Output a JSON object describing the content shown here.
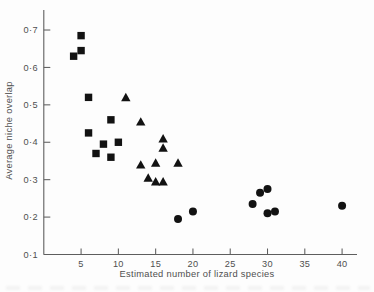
{
  "figure": {
    "background": "#fdfdfd",
    "axis_color": "#5e5e5e",
    "text_color": "#4f4f4f",
    "marker_color": "#121212"
  },
  "chart_data": {
    "type": "scatter",
    "title": "",
    "xlabel": "Estimated number of lizard species",
    "ylabel": "Average niche overlap",
    "xlim": [
      0,
      42
    ],
    "ylim": [
      0.1,
      0.7535
    ],
    "grid": false,
    "legend": "none",
    "x_ticks": [
      {
        "v": 5,
        "label": "5"
      },
      {
        "v": 10,
        "label": "10"
      },
      {
        "v": 15,
        "label": "15"
      },
      {
        "v": 20,
        "label": "20"
      },
      {
        "v": 25,
        "label": "25"
      },
      {
        "v": 30,
        "label": "30"
      },
      {
        "v": 35,
        "label": "35"
      },
      {
        "v": 40,
        "label": "40"
      }
    ],
    "y_ticks": [
      {
        "v": 0.1,
        "label": "0·1"
      },
      {
        "v": 0.2,
        "label": "0·2"
      },
      {
        "v": 0.3,
        "label": "0·3"
      },
      {
        "v": 0.4,
        "label": "0·4"
      },
      {
        "v": 0.5,
        "label": "0·5"
      },
      {
        "v": 0.6,
        "label": "0·6"
      },
      {
        "v": 0.7,
        "label": "0·7"
      }
    ],
    "series": [
      {
        "name": "filled-squares",
        "marker": "square",
        "color": "#121212",
        "points": [
          [
            5,
            0.685
          ],
          [
            5,
            0.645
          ],
          [
            4,
            0.63
          ],
          [
            6,
            0.52
          ],
          [
            9,
            0.46
          ],
          [
            6,
            0.425
          ],
          [
            8,
            0.395
          ],
          [
            10,
            0.4
          ],
          [
            7,
            0.37
          ],
          [
            9,
            0.36
          ]
        ]
      },
      {
        "name": "filled-triangles",
        "marker": "triangle",
        "color": "#121212",
        "points": [
          [
            11,
            0.52
          ],
          [
            13,
            0.455
          ],
          [
            16,
            0.41
          ],
          [
            16,
            0.385
          ],
          [
            15,
            0.345
          ],
          [
            13,
            0.34
          ],
          [
            18,
            0.345
          ],
          [
            14,
            0.305
          ],
          [
            15,
            0.295
          ],
          [
            16,
            0.295
          ]
        ]
      },
      {
        "name": "filled-circles",
        "marker": "circle",
        "color": "#121212",
        "points": [
          [
            18,
            0.195
          ],
          [
            20,
            0.215
          ],
          [
            28,
            0.235
          ],
          [
            29,
            0.265
          ],
          [
            30,
            0.275
          ],
          [
            30,
            0.21
          ],
          [
            31,
            0.215
          ],
          [
            40,
            0.23
          ]
        ]
      }
    ]
  }
}
